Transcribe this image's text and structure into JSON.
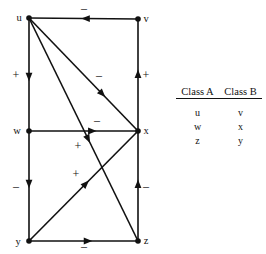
{
  "diagram": {
    "type": "signed-directed-graph",
    "nodes": [
      {
        "id": "u",
        "label": "u",
        "x": 29,
        "y": 18,
        "label_dx": -10,
        "label_dy": 3
      },
      {
        "id": "v",
        "label": "v",
        "x": 138,
        "y": 19,
        "label_dx": 8,
        "label_dy": 3
      },
      {
        "id": "w",
        "label": "w",
        "x": 29,
        "y": 131,
        "label_dx": -12,
        "label_dy": 3
      },
      {
        "id": "x",
        "label": "x",
        "x": 138,
        "y": 131,
        "label_dx": 8,
        "label_dy": 3
      },
      {
        "id": "y",
        "label": "y",
        "x": 29,
        "y": 241,
        "label_dx": -11,
        "label_dy": 4
      },
      {
        "id": "z",
        "label": "z",
        "x": 138,
        "y": 241,
        "label_dx": 8,
        "label_dy": 3
      }
    ],
    "edges": [
      {
        "id": "v-u",
        "from": "v",
        "to": "u",
        "sign": "–",
        "sign_x": 84,
        "sign_y": 12,
        "arrow_t": 0.52
      },
      {
        "id": "u-w",
        "from": "u",
        "to": "w",
        "sign": "+",
        "sign_x": 16,
        "sign_y": 79,
        "arrow_t": 0.56
      },
      {
        "id": "x-v",
        "from": "x",
        "to": "v",
        "sign": "+",
        "sign_x": 146,
        "sign_y": 79,
        "arrow_t": 0.55
      },
      {
        "id": "w-x",
        "from": "w",
        "to": "x",
        "sign": "–",
        "sign_x": 97,
        "sign_y": 124,
        "arrow_t": 0.62
      },
      {
        "id": "w-y",
        "from": "w",
        "to": "y",
        "sign": "–",
        "sign_x": 16,
        "sign_y": 190,
        "arrow_t": 0.52
      },
      {
        "id": "z-x",
        "from": "z",
        "to": "x",
        "sign": "–",
        "sign_x": 146,
        "sign_y": 190,
        "arrow_t": 0.56
      },
      {
        "id": "y-z",
        "from": "y",
        "to": "z",
        "sign": "–",
        "sign_x": 84,
        "sign_y": 250,
        "arrow_t": 0.58
      },
      {
        "id": "u-x",
        "from": "u",
        "to": "x",
        "sign": "–",
        "sign_x": 99,
        "sign_y": 79,
        "arrow_t": 0.7
      },
      {
        "id": "u-z",
        "from": "u",
        "to": "z",
        "sign": "+",
        "sign_x": 78,
        "sign_y": 150,
        "arrow_t": 0.56
      },
      {
        "id": "y-x",
        "from": "y",
        "to": "x",
        "sign": "+",
        "sign_x": 76,
        "sign_y": 178,
        "arrow_t": 0.55
      }
    ]
  },
  "class_table": {
    "headers": [
      "Class A",
      "Class B"
    ],
    "rows": [
      [
        "u",
        "v"
      ],
      [
        "w",
        "x"
      ],
      [
        "z",
        "y"
      ]
    ]
  }
}
